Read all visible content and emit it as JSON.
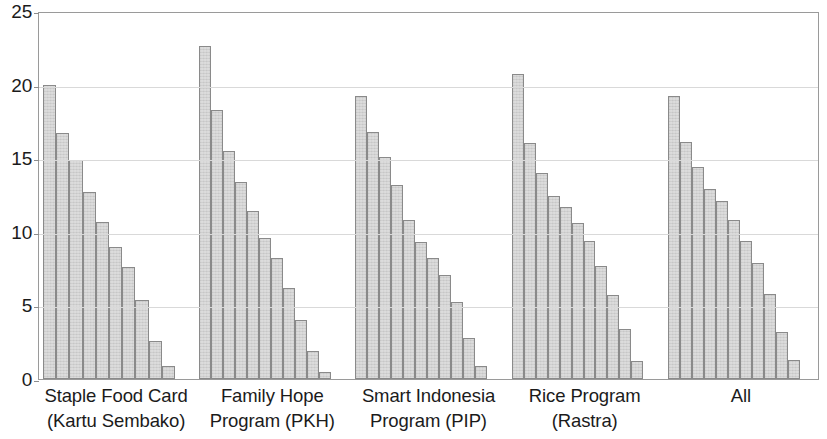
{
  "chart_data": {
    "type": "bar",
    "title": "",
    "subtitle": "",
    "xlabel": "",
    "ylabel": "",
    "ylim": [
      0,
      25
    ],
    "y_ticks": [
      0,
      5,
      10,
      15,
      20,
      25
    ],
    "y_tick_labels": [
      "0",
      "5",
      "10",
      "15",
      "20",
      "25"
    ],
    "grid": true,
    "legend": "none",
    "categories": [
      "Staple Food Card (Kartu Sembako)",
      "Family Hope Program (PKH)",
      "Smart Indonesia Program (PIP)",
      "Rice Program (Rastra)",
      "All"
    ],
    "category_lines": [
      [
        "Staple Food Card",
        "(Kartu Sembako)"
      ],
      [
        "Family Hope",
        "Program (PKH)"
      ],
      [
        "Smart Indonesia",
        "Program (PIP)"
      ],
      [
        "Rice Program",
        "(Rastra)"
      ],
      [
        "All",
        ""
      ]
    ],
    "bars_per_group": 10,
    "groups": [
      {
        "label": "Staple Food Card (Kartu Sembako)",
        "values": [
          20.0,
          16.7,
          14.9,
          12.7,
          10.7,
          9.0,
          7.6,
          5.4,
          2.6,
          0.9
        ]
      },
      {
        "label": "Family Hope Program (PKH)",
        "values": [
          22.6,
          18.3,
          15.5,
          13.4,
          11.4,
          9.6,
          8.2,
          6.2,
          4.0,
          1.9,
          0.5
        ]
      },
      {
        "label": "Smart Indonesia Program (PIP)",
        "values": [
          19.2,
          16.8,
          15.1,
          13.2,
          10.8,
          9.3,
          8.2,
          7.1,
          5.2,
          2.8,
          0.9
        ]
      },
      {
        "label": "Rice Program (Rastra)",
        "values": [
          20.7,
          16.0,
          14.0,
          12.4,
          11.7,
          10.6,
          9.4,
          7.7,
          5.7,
          3.4,
          1.2
        ]
      },
      {
        "label": "All",
        "values": [
          19.2,
          16.1,
          14.4,
          12.9,
          12.1,
          10.8,
          9.4,
          7.9,
          5.8,
          3.2,
          1.3
        ]
      }
    ],
    "colors": {
      "bar_fill": "#cccccc",
      "bar_stroke": "#8a8a8a",
      "gridline": "#d9d9d9",
      "axis": "#9a9a9a",
      "text": "#1b1b1b",
      "background": "#ffffff"
    }
  }
}
